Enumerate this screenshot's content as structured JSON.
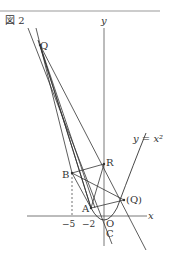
{
  "figure": {
    "title": "図 2",
    "curve_label": "y = x²",
    "axis_x_label": "x",
    "axis_y_label": "y",
    "origin_label": "O",
    "ticks": {
      "x_neg5": "−5",
      "x_neg2": "−2"
    },
    "points": {
      "Q": "Q",
      "Q_alt": "(Q)",
      "R": "R",
      "B": "B",
      "A": "A",
      "C": "C"
    },
    "colors": {
      "line": "#333333",
      "background": "#ffffff",
      "border": "#999999"
    }
  }
}
